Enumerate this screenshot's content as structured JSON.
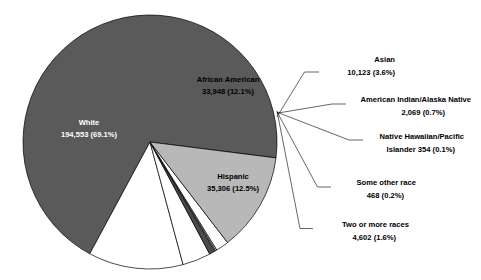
{
  "chart_data": {
    "type": "pie",
    "title": "",
    "subtitle": "",
    "xlabel": "",
    "ylabel": "",
    "legend_position": "none",
    "grid": false,
    "total": 279903,
    "categories": [
      "White",
      "African American",
      "Hispanic",
      "Asian",
      "American Indian/Alaska Native",
      "Native Hawaiian/Pacific Islander",
      "Some other race",
      "Two or more races"
    ],
    "values": [
      194553,
      33948,
      35306,
      10123,
      2069,
      354,
      468,
      4602
    ],
    "percents": [
      69.1,
      12.1,
      12.5,
      3.6,
      0.7,
      0.1,
      0.2,
      1.6
    ],
    "colors": [
      "#5a5a5a",
      "#ffffff",
      "#b8b8b8",
      "#ffffff",
      "#4a4a4a",
      "#ffffff",
      "#d8d8d8",
      "#ffffff"
    ],
    "slices": [
      {
        "name": "White",
        "label": "White",
        "value_text": "194,553 (69.1%)",
        "value": 194553,
        "percent": 69.1,
        "color": "#5a5a5a",
        "label_style": "inside-dark"
      },
      {
        "name": "African American",
        "label": "African American",
        "value_text": "33,948 (12.1%)",
        "value": 33948,
        "percent": 12.1,
        "color": "#ffffff",
        "label_style": "inside-light"
      },
      {
        "name": "Hispanic",
        "label": "Hispanic",
        "value_text": "35,306 (12.5%)",
        "value": 35306,
        "percent": 12.5,
        "color": "#b8b8b8",
        "label_style": "inside-light"
      },
      {
        "name": "Asian",
        "label": "Asian",
        "value_text": "10,123 (3.6%)",
        "value": 10123,
        "percent": 3.6,
        "color": "#ffffff",
        "label_style": "callout"
      },
      {
        "name": "American Indian/Alaska Native",
        "label": "American Indian/Alaska Native",
        "value_text": "2,069 (0.7%)",
        "value": 2069,
        "percent": 0.7,
        "color": "#4a4a4a",
        "label_style": "callout"
      },
      {
        "name": "Native Hawaiian/Pacific Islander",
        "label": "Native Hawaiian/Pacific",
        "label_line2": "Islander  354 (0.1%)",
        "value_text": "354 (0.1%)",
        "value": 354,
        "percent": 0.1,
        "color": "#ffffff",
        "label_style": "callout"
      },
      {
        "name": "Some other race",
        "label": "Some other race",
        "value_text": "468 (0.2%)",
        "value": 468,
        "percent": 0.2,
        "color": "#d8d8d8",
        "label_style": "callout"
      },
      {
        "name": "Two or more races",
        "label": "Two or more races",
        "value_text": "4,602 (1.6%)",
        "value": 4602,
        "percent": 1.6,
        "color": "#ffffff",
        "label_style": "callout"
      }
    ]
  },
  "labels": {
    "white_name": "White",
    "white_value": "194,553 (69.1%)",
    "african_american_name": "African American",
    "african_american_value": "33,948 (12.1%)",
    "hispanic_name": "Hispanic",
    "hispanic_value": "35,306 (12.5%)",
    "asian_name": "Asian",
    "asian_value": "10,123 (3.6%)",
    "amerindian_name": "American Indian/Alaska Native",
    "amerindian_value": "2,069 (0.7%)",
    "hawaiian_name": "Native Hawaiian/Pacific",
    "hawaiian_value": "Islander  354 (0.1%)",
    "someother_name": "Some other race",
    "someother_value": "468 (0.2%)",
    "twoormore_name": "Two or more races",
    "twoormore_value": "4,602 (1.6%)"
  }
}
